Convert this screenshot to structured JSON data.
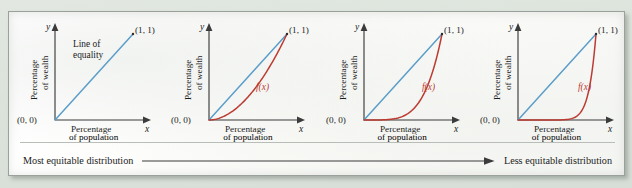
{
  "figure": {
    "background_color": "#dde4dd",
    "panel_color": "#fdfdfb",
    "equality_line_color": "#5b9ec9",
    "curve_color": "#bc3b32",
    "axis_color": "#3b3b3b"
  },
  "scale": {
    "left_label": "Most equitable distribution",
    "right_label": "Less equitable distribution",
    "arrow_direction": "right"
  },
  "common": {
    "x_axis_var": "x",
    "y_axis_var": "y",
    "origin_label": "(0, 0)",
    "corner_label": "(1, 1)",
    "x_caption_line1": "Percentage",
    "x_caption_line2": "of population",
    "y_caption_line1": "Percentage",
    "y_caption_line2": "of wealth"
  },
  "chart_data": [
    {
      "type": "line",
      "title": "Line of equality only",
      "annotation_line1": "Line of",
      "annotation_line2": "equality",
      "curve_label": "",
      "xlabel": "Percentage of population",
      "ylabel": "Percentage of wealth",
      "xlim": [
        0,
        1
      ],
      "ylim": [
        0,
        1
      ],
      "grid": false,
      "series": [
        {
          "name": "Line of equality",
          "color": "#5b9ec9",
          "exponent": 1,
          "x": [
            0,
            0.1,
            0.2,
            0.3,
            0.4,
            0.5,
            0.6,
            0.7,
            0.8,
            0.9,
            1
          ],
          "values": [
            0,
            0.1,
            0.2,
            0.3,
            0.4,
            0.5,
            0.6,
            0.7,
            0.8,
            0.9,
            1
          ]
        }
      ]
    },
    {
      "type": "line",
      "title": "Mildly unequal distribution",
      "annotation_line1": "",
      "annotation_line2": "",
      "curve_label": "f(x)",
      "xlabel": "Percentage of population",
      "ylabel": "Percentage of wealth",
      "xlim": [
        0,
        1
      ],
      "ylim": [
        0,
        1
      ],
      "grid": false,
      "series": [
        {
          "name": "Line of equality",
          "color": "#5b9ec9",
          "exponent": 1,
          "x": [
            0,
            0.25,
            0.5,
            0.75,
            1
          ],
          "values": [
            0,
            0.25,
            0.5,
            0.75,
            1
          ]
        },
        {
          "name": "f(x)",
          "color": "#bc3b32",
          "exponent": 1.9,
          "x": [
            0,
            0.1,
            0.2,
            0.3,
            0.4,
            0.5,
            0.6,
            0.7,
            0.8,
            0.9,
            1
          ],
          "values": [
            0,
            0.013,
            0.048,
            0.102,
            0.175,
            0.268,
            0.379,
            0.509,
            0.657,
            0.82,
            1
          ]
        }
      ]
    },
    {
      "type": "line",
      "title": "Strongly unequal distribution",
      "annotation_line1": "",
      "annotation_line2": "",
      "curve_label": "f(x)",
      "xlabel": "Percentage of population",
      "ylabel": "Percentage of wealth",
      "xlim": [
        0,
        1
      ],
      "ylim": [
        0,
        1
      ],
      "grid": false,
      "series": [
        {
          "name": "Line of equality",
          "color": "#5b9ec9",
          "exponent": 1,
          "x": [
            0,
            0.25,
            0.5,
            0.75,
            1
          ],
          "values": [
            0,
            0.25,
            0.5,
            0.75,
            1
          ]
        },
        {
          "name": "f(x)",
          "color": "#bc3b32",
          "exponent": 4.5,
          "x": [
            0,
            0.1,
            0.2,
            0.3,
            0.4,
            0.5,
            0.6,
            0.7,
            0.8,
            0.9,
            1
          ],
          "values": [
            0,
            0.0,
            0.001,
            0.005,
            0.016,
            0.044,
            0.1,
            0.201,
            0.362,
            0.63,
            1
          ]
        }
      ]
    },
    {
      "type": "line",
      "title": "Extremely unequal distribution",
      "annotation_line1": "",
      "annotation_line2": "",
      "curve_label": "f(x)",
      "xlabel": "Percentage of population",
      "ylabel": "Percentage of wealth",
      "xlim": [
        0,
        1
      ],
      "ylim": [
        0,
        1
      ],
      "grid": false,
      "series": [
        {
          "name": "Line of equality",
          "color": "#5b9ec9",
          "exponent": 1,
          "x": [
            0,
            0.25,
            0.5,
            0.75,
            1
          ],
          "values": [
            0,
            0.25,
            0.5,
            0.75,
            1
          ]
        },
        {
          "name": "f(x)",
          "color": "#bc3b32",
          "exponent": 11,
          "x": [
            0,
            0.1,
            0.2,
            0.3,
            0.4,
            0.5,
            0.6,
            0.7,
            0.8,
            0.9,
            1
          ],
          "values": [
            0,
            0.0,
            0.0,
            0.0,
            0.0,
            0.0005,
            0.0036,
            0.0198,
            0.0859,
            0.314,
            1
          ]
        }
      ]
    }
  ]
}
